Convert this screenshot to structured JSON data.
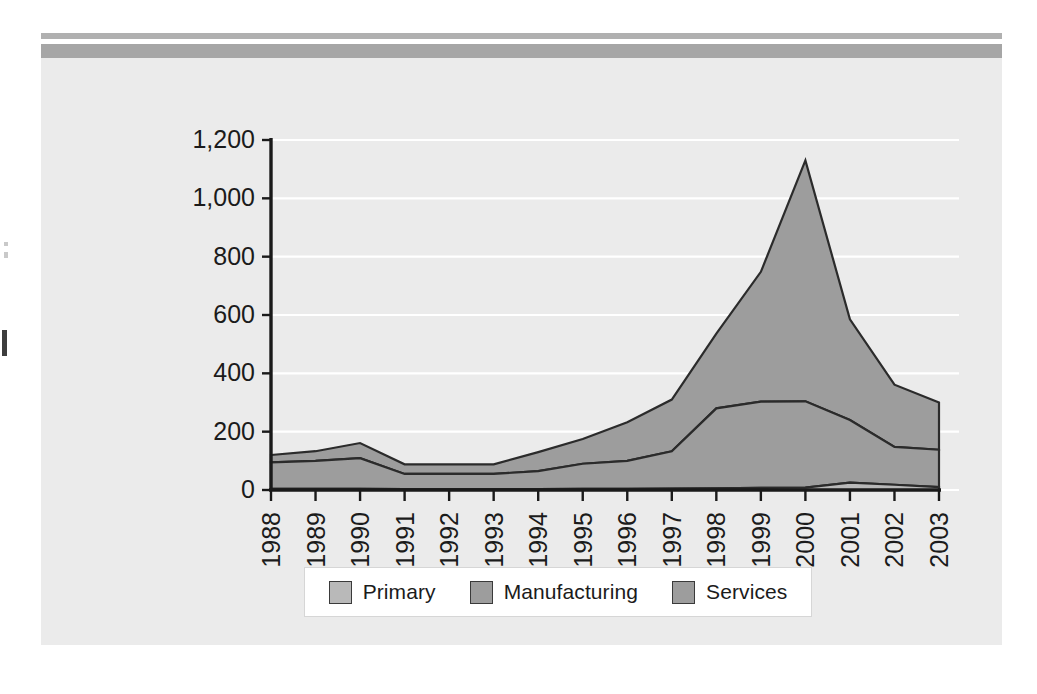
{
  "figure": {
    "background_color": "#ebebeb",
    "rule_top_color": "#b0b0b0",
    "rule_bottom_color": "#a6a6a6"
  },
  "legend": {
    "items": [
      {
        "label": "Primary",
        "color": "#b9b9b9"
      },
      {
        "label": "Manufacturing",
        "color": "#9d9d9d"
      },
      {
        "label": "Services",
        "color": "#9d9d9d"
      }
    ]
  },
  "axis": {
    "y_ticks": [
      "0",
      "200",
      "400",
      "600",
      "800",
      "1,000",
      "1,200"
    ],
    "x_ticks": [
      "1988",
      "1989",
      "1990",
      "1991",
      "1992",
      "1993",
      "1994",
      "1995",
      "1996",
      "1997",
      "1998",
      "1999",
      "2000",
      "2001",
      "2002",
      "2003"
    ]
  },
  "chart_data": {
    "type": "area",
    "stacked": true,
    "title": "",
    "xlabel": "",
    "ylabel": "",
    "ylim": [
      0,
      1200
    ],
    "ytick_step": 200,
    "grid": true,
    "grid_color": "#ffffff",
    "legend_position": "bottom",
    "categories": [
      "1988",
      "1989",
      "1990",
      "1991",
      "1992",
      "1993",
      "1994",
      "1995",
      "1996",
      "1997",
      "1998",
      "1999",
      "2000",
      "2001",
      "2002",
      "2003"
    ],
    "series": [
      {
        "name": "Primary",
        "color": "#b9b9b9",
        "values": [
          4,
          4,
          4,
          3,
          3,
          3,
          3,
          4,
          4,
          5,
          6,
          7,
          8,
          25,
          18,
          10
        ]
      },
      {
        "name": "Manufacturing",
        "color": "#9d9d9d",
        "values": [
          91,
          96,
          105,
          52,
          52,
          52,
          62,
          86,
          96,
          128,
          274,
          296,
          296,
          215,
          130,
          128
        ]
      },
      {
        "name": "Services",
        "color": "#9d9d9d",
        "values": [
          25,
          33,
          52,
          33,
          33,
          33,
          65,
          85,
          132,
          177,
          256,
          445,
          826,
          345,
          213,
          162
        ]
      }
    ],
    "cumulative_totals": [
      120,
      133,
      161,
      88,
      88,
      88,
      130,
      175,
      232,
      310,
      536,
      748,
      1130,
      585,
      361,
      300
    ]
  }
}
